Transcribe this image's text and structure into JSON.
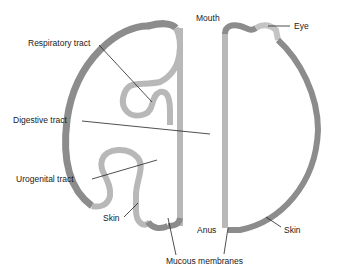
{
  "colors": {
    "skin": "#8c8c8c",
    "mucous": "#b8b8b8",
    "leader": "#222222",
    "text": "#1a1a1a",
    "background": "#ffffff"
  },
  "labels": {
    "mouth": "Mouth",
    "eye": "Eye",
    "respiratory_tract": "Respiratory tract",
    "digestive_tract": "Digestive tract",
    "urogenital_tract": "Urogenital tract",
    "skin_left": "Skin",
    "anus": "Anus",
    "skin_right": "Skin",
    "mucous_membranes": "Mucous membranes"
  }
}
